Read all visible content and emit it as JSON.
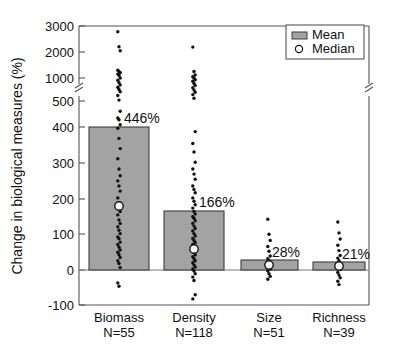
{
  "chart_data": {
    "type": "bar",
    "title": "",
    "xlabel": "",
    "ylabel": "Change in biological measures (%)",
    "grid": false,
    "legend_position": "top-right",
    "broken_axis": true,
    "axis_break_between": [
      500,
      1000
    ],
    "ylim": [
      -100,
      3000
    ],
    "ytick_labels": [
      "3000",
      "2000",
      "1000",
      "500",
      "400",
      "300",
      "200",
      "100",
      "0",
      "-100"
    ],
    "ytick_values": [
      3000,
      2000,
      1000,
      500,
      400,
      300,
      200,
      100,
      0,
      -100
    ],
    "categories": [
      "Biomass",
      "Density",
      "Size",
      "Richness"
    ],
    "category_sublabels": [
      "N=55",
      "N=118",
      "N=51",
      "N=39"
    ],
    "sample_sizes": [
      55,
      118,
      51,
      39
    ],
    "series": [
      {
        "name": "Mean",
        "values": [
          446,
          166,
          28,
          21
        ],
        "data_labels": [
          "446%",
          "166%",
          "28%",
          "21%"
        ]
      },
      {
        "name": "Median",
        "values": [
          190,
          60,
          16,
          14
        ]
      }
    ],
    "scatter_points": {
      "Biomass": [
        2780,
        2200,
        2050,
        1300,
        1250,
        1200,
        1150,
        1100,
        1000,
        950,
        900,
        850,
        800,
        750,
        700,
        620,
        520,
        470,
        450,
        445,
        430,
        420,
        390,
        360,
        330,
        300,
        280,
        265,
        250,
        235,
        215,
        200,
        195,
        190,
        185,
        175,
        165,
        150,
        140,
        130,
        120,
        110,
        100,
        95,
        85,
        78,
        70,
        62,
        55,
        48,
        40,
        30,
        22,
        10,
        -35,
        -45
      ],
      "Density": [
        2190,
        1250,
        1120,
        1050,
        1000,
        960,
        930,
        880,
        840,
        790,
        740,
        690,
        640,
        560,
        410,
        375,
        350,
        320,
        300,
        285,
        270,
        250,
        240,
        230,
        215,
        205,
        195,
        185,
        175,
        168,
        160,
        155,
        148,
        140,
        132,
        125,
        118,
        110,
        103,
        96,
        90,
        84,
        78,
        72,
        66,
        60,
        54,
        48,
        42,
        36,
        30,
        24,
        18,
        12,
        6,
        0,
        -8,
        -18,
        -28,
        -70,
        -82
      ],
      "Size": [
        152,
        108,
        90,
        72,
        58,
        44,
        36,
        30,
        24,
        18,
        12,
        6,
        0,
        -8,
        -16,
        -24
      ],
      "Richness": [
        144,
        112,
        94,
        76,
        60,
        46,
        38,
        30,
        22,
        16,
        10,
        4,
        -4,
        -12,
        -20,
        -30,
        -40
      ]
    },
    "colors": {
      "bar_fill": "#a3a3a3",
      "bar_edge": "#3c3c3c",
      "point": "#101010",
      "median_fill": "#ffffff",
      "axis": "#555555"
    }
  },
  "legend": {
    "entries": [
      {
        "label": "Mean",
        "marker": "bar-swatch"
      },
      {
        "label": "Median",
        "marker": "circle-open"
      }
    ]
  }
}
